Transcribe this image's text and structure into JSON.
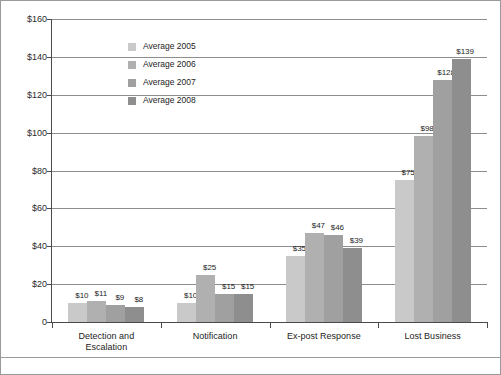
{
  "chart_data": {
    "type": "bar",
    "title": "",
    "subtitle": "",
    "xlabel": "",
    "ylabel": "",
    "ylim": [
      0,
      160
    ],
    "ytick_values": [
      0,
      20,
      40,
      60,
      80,
      100,
      120,
      140,
      160
    ],
    "ytick_labels": [
      "0",
      "$20",
      "$40",
      "$60",
      "$80",
      "$100",
      "$120",
      "$140",
      "$160"
    ],
    "grid": true,
    "grid_axis": "y",
    "legend_position": "inside-upper-left",
    "categories": [
      "Detection and Escalation",
      "Notification",
      "Ex-post Response",
      "Lost Business"
    ],
    "category_lines": [
      [
        "Detection and",
        "Escalation"
      ],
      [
        "Notification"
      ],
      [
        "Ex-post Response"
      ],
      [
        "Lost Business"
      ]
    ],
    "series": [
      {
        "name": "Average 2005",
        "color": "#c9c9c9",
        "values": [
          10,
          10,
          35,
          75
        ],
        "labels": [
          "$10",
          "$10",
          "$35",
          "$75"
        ]
      },
      {
        "name": "Average 2006",
        "color": "#b0b0b0",
        "values": [
          11,
          25,
          47,
          98
        ],
        "labels": [
          "$11",
          "$25",
          "$47",
          "$98"
        ]
      },
      {
        "name": "Average 2007",
        "color": "#a0a0a0",
        "values": [
          9,
          15,
          46,
          128
        ],
        "labels": [
          "$9",
          "$15",
          "$46",
          "$128"
        ]
      },
      {
        "name": "Average 2008",
        "color": "#8e8e8e",
        "values": [
          8,
          15,
          39,
          139
        ],
        "labels": [
          "$8",
          "$15",
          "$39",
          "$139"
        ]
      }
    ]
  },
  "colors": {
    "axis": "#4a4a4a",
    "grid": "#8d8d8d",
    "frame": "#9a9a9a",
    "text": "#1d1d1d",
    "background": "#ffffff"
  }
}
